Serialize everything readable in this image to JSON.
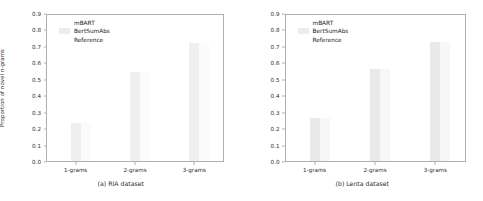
{
  "figure": {
    "panels": [
      {
        "caption": "(a) RIA dataset",
        "ylabel": "Proportion of novel n-grams",
        "legend": [
          "mBART",
          "BertSumAbs",
          "Reference"
        ]
      },
      {
        "caption": "(b) Lenta dataset",
        "ylabel": "",
        "legend": [
          "mBART",
          "BertSumAbs",
          "Reference"
        ]
      }
    ]
  },
  "chart_data": [
    {
      "type": "bar",
      "title": "(a) RIA dataset",
      "categories": [
        "1-grams",
        "2-grams",
        "3-grams"
      ],
      "series": [
        {
          "name": "mBART",
          "values": [
            0.235,
            0.55,
            0.725
          ]
        },
        {
          "name": "BertSumAbs",
          "values": [
            0.235,
            0.55,
            0.725
          ]
        },
        {
          "name": "Reference",
          "values": [
            0.235,
            0.55,
            0.725
          ]
        }
      ],
      "xlabel": "",
      "ylabel": "Proportion of novel n-grams",
      "ylim": [
        0.0,
        0.9
      ],
      "yticks": [
        "0.0",
        "0.1",
        "0.2",
        "0.3",
        "0.4",
        "0.5",
        "0.6",
        "0.7",
        "0.8",
        "0.9"
      ],
      "grid": false,
      "legend_position": "upper left",
      "colors": {
        "mBART": "#ffffff",
        "BertSumAbs": "#efefef",
        "Reference": "#fbfbfb"
      }
    },
    {
      "type": "bar",
      "title": "(b) Lenta dataset",
      "categories": [
        "1-grams",
        "2-grams",
        "3-grams"
      ],
      "series": [
        {
          "name": "mBART",
          "values": [
            0.265,
            0.57,
            0.735
          ]
        },
        {
          "name": "BertSumAbs",
          "values": [
            0.265,
            0.57,
            0.735
          ]
        },
        {
          "name": "Reference",
          "values": [
            0.265,
            0.57,
            0.735
          ]
        }
      ],
      "xlabel": "",
      "ylabel": "",
      "ylim": [
        0.0,
        0.9
      ],
      "yticks": [
        "0.0",
        "0.1",
        "0.2",
        "0.3",
        "0.4",
        "0.5",
        "0.6",
        "0.7",
        "0.8",
        "0.9"
      ],
      "grid": false,
      "legend_position": "upper left",
      "colors": {
        "mBART": "#ffffff",
        "BertSumAbs": "#e9e9e9",
        "Reference": "#f7f7f7"
      }
    }
  ]
}
